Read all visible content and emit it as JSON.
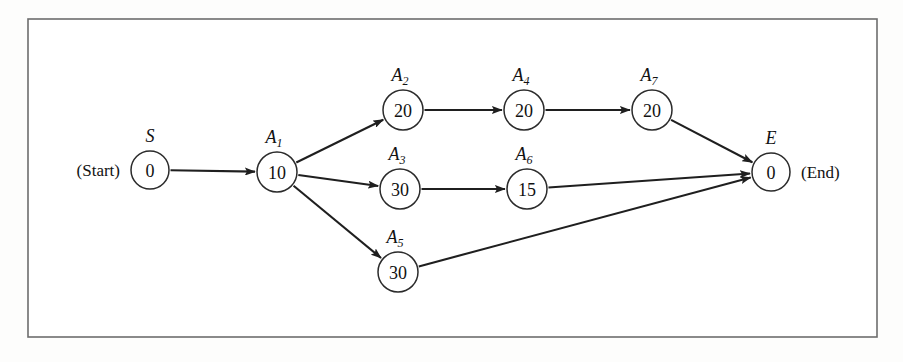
{
  "figure": {
    "background_color": "#fdfdfc",
    "frame_color": "#6d6d6d",
    "node_stroke_color": "#2b2b2b",
    "edge_color": "#1f1f1f",
    "start_caption": "(Start)",
    "end_caption": "(End)"
  },
  "chart_data": {
    "type": "diagram",
    "diagram_type": "activity-on-node-network",
    "node_value_meaning": "activity duration",
    "nodes": [
      {
        "id": "S",
        "label": "S",
        "label_base": "S",
        "label_sub": "",
        "value": "0",
        "x": 150,
        "y": 170,
        "r": 19,
        "caption": "(Start)",
        "caption_side": "left"
      },
      {
        "id": "A1",
        "label": "A1",
        "label_base": "A",
        "label_sub": "1",
        "value": "10",
        "x": 277,
        "y": 172,
        "r": 20,
        "caption": "",
        "caption_side": ""
      },
      {
        "id": "A2",
        "label": "A2",
        "label_base": "A",
        "label_sub": "2",
        "value": "20",
        "x": 403,
        "y": 110,
        "r": 20,
        "caption": "",
        "caption_side": ""
      },
      {
        "id": "A3",
        "label": "A3",
        "label_base": "A",
        "label_sub": "3",
        "value": "30",
        "x": 400,
        "y": 189,
        "r": 20,
        "caption": "",
        "caption_side": ""
      },
      {
        "id": "A4",
        "label": "A4",
        "label_base": "A",
        "label_sub": "4",
        "value": "20",
        "x": 524,
        "y": 110,
        "r": 20,
        "caption": "",
        "caption_side": ""
      },
      {
        "id": "A5",
        "label": "A5",
        "label_base": "A",
        "label_sub": "5",
        "value": "30",
        "x": 398,
        "y": 272,
        "r": 20,
        "caption": "",
        "caption_side": ""
      },
      {
        "id": "A6",
        "label": "A6",
        "label_base": "A",
        "label_sub": "6",
        "value": "15",
        "x": 527,
        "y": 189,
        "r": 20,
        "caption": "",
        "caption_side": ""
      },
      {
        "id": "A7",
        "label": "A7",
        "label_base": "A",
        "label_sub": "7",
        "value": "20",
        "x": 652,
        "y": 110,
        "r": 20,
        "caption": "",
        "caption_side": ""
      },
      {
        "id": "E",
        "label": "E",
        "label_base": "E",
        "label_sub": "",
        "value": "0",
        "x": 771,
        "y": 172,
        "r": 19,
        "caption": "(End)",
        "caption_side": "right"
      }
    ],
    "edges": [
      {
        "from": "S",
        "to": "A1"
      },
      {
        "from": "A1",
        "to": "A2"
      },
      {
        "from": "A1",
        "to": "A3"
      },
      {
        "from": "A1",
        "to": "A5"
      },
      {
        "from": "A2",
        "to": "A4"
      },
      {
        "from": "A4",
        "to": "A7"
      },
      {
        "from": "A3",
        "to": "A6"
      },
      {
        "from": "A7",
        "to": "E"
      },
      {
        "from": "A6",
        "to": "E"
      },
      {
        "from": "A5",
        "to": "E"
      }
    ],
    "frame": {
      "x": 28,
      "y": 19,
      "width": 849,
      "height": 318
    }
  }
}
